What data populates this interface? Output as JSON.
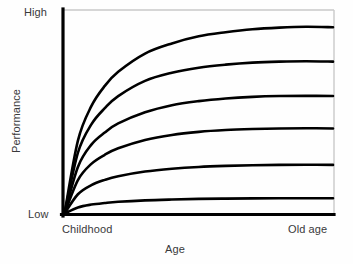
{
  "chart_data": {
    "type": "line",
    "title": "",
    "subtitle": "",
    "xlabel": "Age",
    "ylabel": "Performance",
    "xlim": [
      0,
      1
    ],
    "ylim": [
      0,
      1
    ],
    "grid": false,
    "legend": "none",
    "x_tick_labels": [
      "Childhood",
      "Old age"
    ],
    "y_tick_labels": [
      "Low",
      "High"
    ],
    "annotations": [],
    "x": [
      0,
      0.05,
      0.1,
      0.15,
      0.2,
      0.3,
      0.4,
      0.5,
      0.6,
      0.7,
      0.8,
      0.9,
      1.0
    ],
    "series": [
      {
        "name": "curve-1",
        "asymptote": 0.92,
        "values": [
          0,
          0.36,
          0.53,
          0.63,
          0.7,
          0.79,
          0.84,
          0.875,
          0.895,
          0.91,
          0.918,
          0.922,
          0.92
        ]
      },
      {
        "name": "curve-2",
        "asymptote": 0.75,
        "values": [
          0,
          0.3,
          0.44,
          0.52,
          0.58,
          0.655,
          0.695,
          0.72,
          0.735,
          0.745,
          0.75,
          0.752,
          0.75
        ]
      },
      {
        "name": "curve-3",
        "asymptote": 0.58,
        "values": [
          0,
          0.23,
          0.34,
          0.4,
          0.445,
          0.5,
          0.535,
          0.555,
          0.568,
          0.576,
          0.58,
          0.581,
          0.58
        ]
      },
      {
        "name": "curve-4",
        "asymptote": 0.42,
        "values": [
          0,
          0.165,
          0.245,
          0.29,
          0.322,
          0.363,
          0.388,
          0.403,
          0.412,
          0.417,
          0.42,
          0.421,
          0.42
        ]
      },
      {
        "name": "curve-5",
        "asymptote": 0.24,
        "values": [
          0,
          0.095,
          0.14,
          0.166,
          0.184,
          0.207,
          0.221,
          0.23,
          0.235,
          0.238,
          0.24,
          0.241,
          0.24
        ]
      },
      {
        "name": "curve-6",
        "asymptote": 0.075,
        "values": [
          0,
          0.03,
          0.044,
          0.052,
          0.058,
          0.065,
          0.069,
          0.072,
          0.0735,
          0.0745,
          0.075,
          0.0752,
          0.075
        ]
      }
    ],
    "colors": {
      "curve": "#000000",
      "axis": "#000000",
      "frame": "#c9c9c9",
      "background": "#fefefe",
      "text": "#39393b"
    }
  },
  "labels": {
    "y_high": "High",
    "y_low": "Low",
    "x_start": "Childhood",
    "x_end": "Old age",
    "x_axis_title": "Age",
    "y_axis_title": "Performance"
  }
}
